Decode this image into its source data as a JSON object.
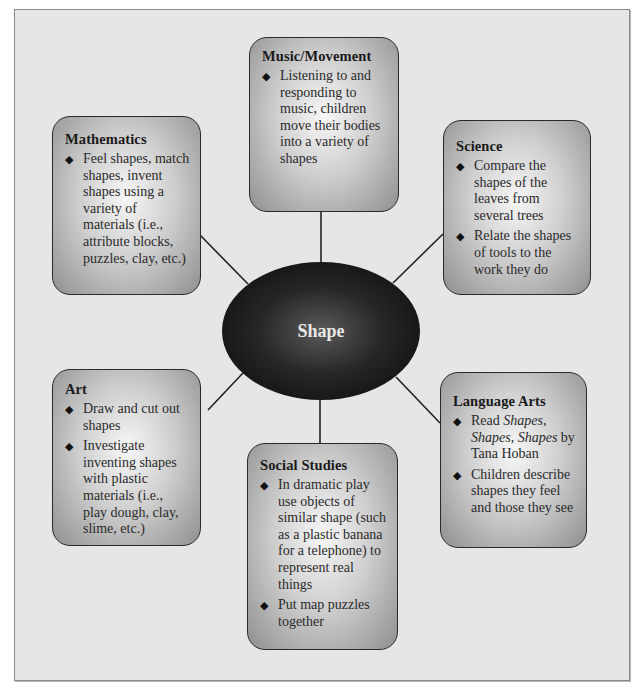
{
  "diagram": {
    "central_topic": "Shape",
    "nodes": [
      {
        "id": "music-movement",
        "title": "Music/Movement",
        "items": [
          "Listening to and responding to music, children move their bodies into a variety of shapes"
        ]
      },
      {
        "id": "mathematics",
        "title": "Mathematics",
        "items": [
          "Feel shapes, match shapes, invent shapes using a variety of materials (i.e., attribute blocks, puzzles, clay, etc.)"
        ]
      },
      {
        "id": "science",
        "title": "Science",
        "items": [
          "Compare the shapes of the leaves from several trees",
          "Relate the shapes of tools to the work they do"
        ]
      },
      {
        "id": "art",
        "title": "Art",
        "items": [
          "Draw and cut out shapes",
          "Investigate inventing shapes with plastic materials (i.e., play dough, clay, slime, etc.)"
        ]
      },
      {
        "id": "social-studies",
        "title": "Social Studies",
        "items": [
          "In dramatic play use objects of similar shape (such as a plastic banana for a telephone) to represent real things",
          "Put map puzzles together"
        ]
      },
      {
        "id": "language-arts",
        "title": "Language Arts",
        "items_rich": [
          {
            "pre": "Read ",
            "italic": "Shapes, Shapes, Shapes",
            "post": " by Tana Hoban"
          }
        ],
        "items": [
          "Children describe shapes they feel and those they see"
        ]
      }
    ],
    "bullet_glyph": "◆",
    "colors": {
      "panel_bg": "#e6e6e6",
      "box_center": "#f7f7f7",
      "box_edge": "#8f8f8f",
      "ellipse": "#111111",
      "connector": "#222222"
    }
  }
}
